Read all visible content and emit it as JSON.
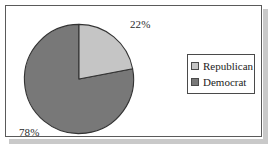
{
  "chart_data": {
    "type": "pie",
    "title": "",
    "categories": [
      "Republican",
      "Democrat"
    ],
    "values": [
      22,
      78
    ],
    "value_unit": "%",
    "data_labels": [
      "22%",
      "78%"
    ],
    "colors": [
      "#c5c5c5",
      "#787878"
    ],
    "slice_border_color": "#333333",
    "start_angle_deg": 0,
    "direction": "clockwise",
    "legend": {
      "position": "right",
      "entries": [
        {
          "label": "Republican",
          "color": "#c5c5c5"
        },
        {
          "label": "Democrat",
          "color": "#787878"
        }
      ]
    },
    "labels": {
      "republican_pct": "22%",
      "democrat_pct": "78%"
    },
    "grid": false,
    "xlabel": "",
    "ylabel": ""
  },
  "frame": {
    "border_color": "#5a5a5a",
    "background": "#ffffff",
    "shadow_color": "#c9c9c9"
  }
}
